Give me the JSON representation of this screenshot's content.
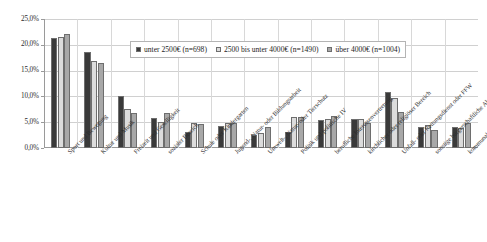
{
  "chart_data": {
    "type": "bar",
    "title": "",
    "subtitle": "",
    "xlabel": "",
    "ylabel": "",
    "ylim": [
      0,
      25
    ],
    "grid": true,
    "legend_position": "top-center-inside",
    "y_ticks": [
      "0,0%",
      "5,0%",
      "10,0%",
      "15,0%",
      "20,0%",
      "25,0%"
    ],
    "y_tick_values": [
      0,
      5,
      10,
      15,
      20,
      25
    ],
    "categories": [
      "Sport und Bewegung",
      "Kultur und Musik",
      "Freizeit und Geselligkeit",
      "sozialer Bereich",
      "Schule oder Kindergarten",
      "Jugend-, Natur- oder Bildungsarbeit",
      "Umwelt-, Natur- oder Tierschutz",
      "Politik und politische IV",
      "berufliche Interessenvertretung",
      "kirchlicher oder religiöser Bereich",
      "Unfall- oder Rettungsdienst oder FFW",
      "sonstige bürgerschaftliche Aktivität",
      "kommunale Einrichtungen / IG"
    ],
    "series": [
      {
        "name": "unter 2500€ (n=698)",
        "color": "#3a3a3a",
        "values": [
          21.4,
          18.7,
          10.0,
          5.8,
          3.1,
          4.3,
          2.5,
          3.2,
          5.5,
          5.6,
          10.8,
          4.0,
          4.1
        ]
      },
      {
        "name": "2500 bis unter 4000€ (n=1490)",
        "color": "#dcdcdc",
        "values": [
          21.6,
          16.8,
          7.6,
          5.0,
          4.8,
          4.8,
          3.0,
          6.0,
          5.6,
          5.6,
          9.6,
          4.4,
          3.9
        ]
      },
      {
        "name": "über 4000€ (n=1004)",
        "color": "#a8a8a8",
        "values": [
          22.1,
          16.4,
          6.8,
          6.7,
          4.7,
          4.8,
          4.1,
          6.0,
          6.2,
          4.9,
          7.0,
          3.5,
          4.8
        ]
      }
    ]
  },
  "legend": {
    "entries": [
      {
        "label": "unter 2500€ (n=698)",
        "color": "#3a3a3a"
      },
      {
        "label": "2500 bis unter 4000€ (n=1490)",
        "color": "#dcdcdc"
      },
      {
        "label": "über 4000€ (n=1004)",
        "color": "#a8a8a8"
      }
    ]
  },
  "axis": {
    "y_labels": [
      "25,0%",
      "20,0%",
      "15,0%",
      "10,0%",
      "5,0%",
      "0,0%"
    ]
  }
}
